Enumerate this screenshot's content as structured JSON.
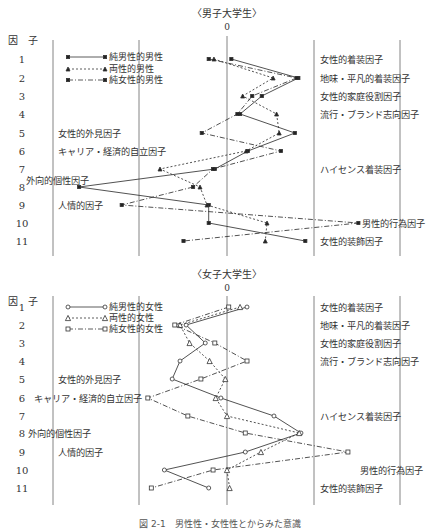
{
  "caption": "図 2-1　男性性・女性性とからみた意識",
  "axis_column_header": "因　子",
  "zero_label": "0",
  "chart_data": [
    {
      "type": "line",
      "title": "〈男子大学生〉",
      "orientation": "horizontal-profile",
      "xlabel": "",
      "ylabel": "因子",
      "categories": [
        "1",
        "2",
        "3",
        "4",
        "5",
        "6",
        "7",
        "8",
        "9",
        "10",
        "11"
      ],
      "factor_names": [
        "女性的着装因子",
        "地味・平凡的着装因子",
        "女性的家庭役割因子",
        "流行・ブランド志向因子",
        "女性的外見因子",
        "キャリア・経済的自立因子",
        "ハイセンス着装因子",
        "外向的個性因子",
        "人情的因子",
        "男性的行為因子",
        "女性的装飾因子"
      ],
      "xlim": [
        -2,
        2
      ],
      "grid_lines_at": [
        -2,
        -1,
        0,
        1,
        2
      ],
      "legend_position": "upper-left",
      "series": [
        {
          "name": "純男性的男性",
          "line": "solid",
          "marker": "filled-square",
          "values": [
            0.05,
            0.82,
            0.4,
            0.15,
            0.78,
            0.24,
            -0.14,
            -1.7,
            -0.21,
            -0.21,
            0.9
          ]
        },
        {
          "name": "両性的男性",
          "line": "dotted",
          "marker": "filled-triangle",
          "values": [
            -0.15,
            0.53,
            0.18,
            0.57,
            0.6,
            0.22,
            -0.77,
            -0.31,
            -0.23,
            0.46,
            0.44
          ]
        },
        {
          "name": "純女性的男性",
          "line": "dash-dot",
          "marker": "filled-square",
          "values": [
            -0.21,
            0.8,
            0.29,
            0.12,
            -0.29,
            0.62,
            -0.16,
            -0.39,
            -1.21,
            1.51,
            -0.5
          ]
        }
      ]
    },
    {
      "type": "line",
      "title": "〈女子大学生〉",
      "orientation": "horizontal-profile",
      "xlabel": "",
      "ylabel": "因子",
      "categories": [
        "1",
        "2",
        "3",
        "4",
        "5",
        "6",
        "7",
        "8",
        "9",
        "10",
        "11"
      ],
      "factor_names": [
        "女性的着装因子",
        "地味・平凡的着装因子",
        "女性的家庭役割因子",
        "流行・ブランド志向因子",
        "女性的外見因子",
        "キャリア・経済的自立因子",
        "ハイセンス着装因子",
        "外向的個性因子",
        "人情的因子",
        "男性的行為因子",
        "女性的装飾因子"
      ],
      "xlim": [
        -2,
        2
      ],
      "grid_lines_at": [
        -2,
        -1,
        0,
        1,
        2
      ],
      "legend_position": "upper-left",
      "series": [
        {
          "name": "純男性的女性",
          "line": "solid",
          "marker": "open-circle",
          "values": [
            0.23,
            -0.47,
            -0.25,
            -0.54,
            -0.63,
            -0.07,
            0.54,
            0.85,
            0.21,
            -0.72,
            -0.21
          ]
        },
        {
          "name": "両性的女性",
          "line": "dotted",
          "marker": "open-triangle",
          "values": [
            0.15,
            -0.54,
            -0.43,
            -0.2,
            -0.02,
            -0.13,
            0.0,
            0.83,
            0.39,
            0.0,
            0.03
          ]
        },
        {
          "name": "純女性的女性",
          "line": "dash-dot",
          "marker": "open-square",
          "values": [
            0.02,
            -0.6,
            -0.14,
            0.23,
            -0.3,
            -0.91,
            -0.45,
            0.21,
            1.39,
            -0.16,
            -0.87
          ]
        }
      ]
    }
  ],
  "layouts": [
    {
      "title_y": 17,
      "zero_y": 30,
      "header_y": 44,
      "line_top": 40,
      "line_bottom": 256,
      "zero_top": 36,
      "row_y": [
        59,
        78,
        96,
        114,
        133,
        151,
        169,
        187,
        205,
        223,
        241
      ],
      "label_pos": [
        {
          "x": 320,
          "y": 59,
          "anchor": "start"
        },
        {
          "x": 320,
          "y": 78,
          "anchor": "start"
        },
        {
          "x": 320,
          "y": 96,
          "anchor": "start"
        },
        {
          "x": 320,
          "y": 114,
          "anchor": "start"
        },
        {
          "x": 58,
          "y": 133,
          "anchor": "start"
        },
        {
          "x": 58,
          "y": 151,
          "anchor": "start"
        },
        {
          "x": 320,
          "y": 169,
          "anchor": "start"
        },
        {
          "x": 26,
          "y": 180,
          "anchor": "start"
        },
        {
          "x": 58,
          "y": 205,
          "anchor": "start"
        },
        {
          "x": 362,
          "y": 223,
          "anchor": "start"
        },
        {
          "x": 320,
          "y": 241,
          "anchor": "start"
        }
      ],
      "legend_y": [
        57,
        69,
        80
      ]
    },
    {
      "title_y": 278,
      "zero_y": 291,
      "header_y": 305,
      "line_top": 296,
      "line_bottom": 505,
      "zero_top": 296,
      "row_y": [
        307,
        325,
        343,
        361,
        379,
        398,
        416,
        433,
        452,
        470,
        488
      ],
      "label_pos": [
        {
          "x": 320,
          "y": 307,
          "anchor": "start"
        },
        {
          "x": 320,
          "y": 325,
          "anchor": "start"
        },
        {
          "x": 320,
          "y": 343,
          "anchor": "start"
        },
        {
          "x": 320,
          "y": 361,
          "anchor": "start"
        },
        {
          "x": 58,
          "y": 379,
          "anchor": "start"
        },
        {
          "x": 34,
          "y": 398,
          "anchor": "start"
        },
        {
          "x": 320,
          "y": 416,
          "anchor": "start"
        },
        {
          "x": 28,
          "y": 433,
          "anchor": "start"
        },
        {
          "x": 58,
          "y": 452,
          "anchor": "start"
        },
        {
          "x": 360,
          "y": 470,
          "anchor": "start"
        },
        {
          "x": 320,
          "y": 488,
          "anchor": "start"
        }
      ],
      "legend_y": [
        307,
        318,
        329
      ]
    }
  ],
  "geometry": {
    "zero_x": 227,
    "unit_px": 87,
    "grid_x": [
      53,
      139,
      227,
      314,
      400
    ],
    "row_number_x": 22,
    "header_x": 8,
    "legend_x1": 68,
    "legend_x2": 105,
    "legend_text_x": 109
  }
}
